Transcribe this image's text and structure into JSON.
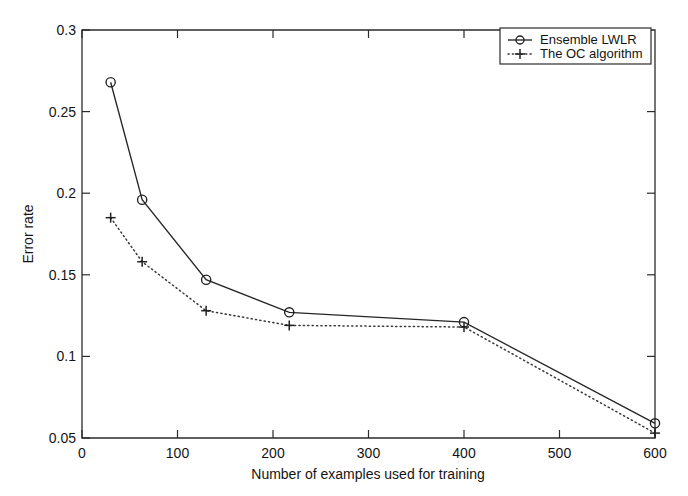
{
  "chart_data": {
    "type": "line",
    "title": "",
    "xlabel": "Number of examples used for training",
    "ylabel": "Error rate",
    "xlim": [
      0,
      600
    ],
    "ylim": [
      0.05,
      0.3
    ],
    "xticks": [
      0,
      100,
      200,
      300,
      400,
      500,
      600
    ],
    "xtick_labels": [
      "0",
      "100",
      "200",
      "300",
      "400",
      "500",
      "600"
    ],
    "yticks": [
      0.05,
      0.1,
      0.15,
      0.2,
      0.25,
      0.3
    ],
    "ytick_labels": [
      "0.05",
      "0.1",
      "0.15",
      "0.2",
      "0.25",
      "0.3"
    ],
    "grid": false,
    "legend_position": "top-right",
    "x": [
      30,
      63,
      130,
      217,
      400,
      600
    ],
    "series": [
      {
        "name": "Ensemble LWLR",
        "marker": "circle",
        "linestyle": "solid",
        "color": "#262626",
        "values": [
          0.268,
          0.196,
          0.147,
          0.127,
          0.121,
          0.059
        ]
      },
      {
        "name": "The OC algorithm",
        "marker": "plus",
        "linestyle": "dotted",
        "color": "#3a3a3a",
        "values": [
          0.185,
          0.158,
          0.128,
          0.119,
          0.118,
          0.053
        ]
      }
    ]
  },
  "legend": {
    "entries": [
      {
        "label": "Ensemble LWLR",
        "marker": "circle-icon"
      },
      {
        "label": "The OC algorithm",
        "marker": "plus-icon"
      }
    ]
  },
  "axes": {
    "x_title": "Number of examples used for training",
    "y_title": "Error rate"
  }
}
